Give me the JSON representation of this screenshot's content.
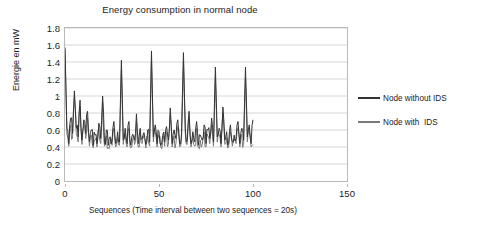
{
  "chart_data": {
    "type": "line",
    "title": "Energy consumption in normal node",
    "xlabel": "Sequences (Time interval between two  sequences = 20s)",
    "ylabel": "Energie en mW",
    "xlim": [
      0,
      150
    ],
    "ylim": [
      0,
      1.8
    ],
    "xticks": [
      "0",
      "50",
      "100",
      "150"
    ],
    "xtick_values": [
      0,
      50,
      100,
      150
    ],
    "yticks": [
      "0",
      "0.2",
      "0.4",
      "0.6",
      "0.8",
      "1",
      "1.2",
      "1.4",
      "1.6",
      "1.8"
    ],
    "ytick_values": [
      0,
      0.2,
      0.4,
      0.6,
      0.8,
      1,
      1.2,
      1.4,
      1.6,
      1.8
    ],
    "grid": "horizontal",
    "legend_position": "right",
    "colors": {
      "series1": "#333333",
      "series2": "#7a7a7a",
      "grid": "#d6d6d6",
      "frame": "#b9b9b9"
    },
    "series": [
      {
        "name": "Node without IDS",
        "color": "#333333",
        "x": [
          0,
          1,
          2,
          3,
          4,
          5,
          6,
          7,
          8,
          9,
          10,
          11,
          12,
          13,
          14,
          15,
          16,
          17,
          18,
          19,
          20,
          21,
          22,
          23,
          24,
          25,
          26,
          27,
          28,
          29,
          30,
          31,
          32,
          33,
          34,
          35,
          36,
          37,
          38,
          39,
          40,
          41,
          42,
          43,
          44,
          45,
          46,
          47,
          48,
          49,
          50,
          51,
          52,
          53,
          54,
          55,
          56,
          57,
          58,
          59,
          60,
          61,
          62,
          63,
          64,
          65,
          66,
          67,
          68,
          69,
          70,
          71,
          72,
          73,
          74,
          75,
          76,
          77,
          78,
          79,
          80,
          81,
          82,
          83,
          84,
          85,
          86,
          87,
          88,
          89,
          90,
          91,
          92,
          93,
          94,
          95,
          96,
          97,
          98,
          99,
          100
        ],
        "values": [
          1.57,
          0.62,
          0.44,
          0.74,
          0.56,
          1.06,
          0.62,
          0.52,
          0.95,
          0.48,
          0.72,
          0.56,
          0.82,
          0.46,
          0.6,
          0.42,
          0.54,
          0.44,
          0.68,
          0.5,
          1.0,
          0.45,
          0.6,
          0.42,
          0.52,
          0.47,
          0.7,
          0.44,
          0.58,
          0.46,
          1.42,
          0.48,
          0.62,
          0.44,
          0.7,
          0.42,
          0.55,
          0.48,
          0.79,
          0.44,
          0.62,
          0.5,
          0.57,
          0.43,
          0.6,
          0.46,
          1.53,
          0.52,
          0.66,
          0.44,
          0.58,
          0.42,
          0.54,
          0.46,
          0.64,
          0.48,
          0.86,
          0.44,
          0.6,
          0.5,
          0.72,
          0.44,
          0.56,
          1.51,
          0.62,
          0.48,
          0.82,
          0.44,
          0.58,
          0.46,
          0.7,
          0.42,
          0.54,
          0.48,
          0.66,
          0.44,
          0.6,
          0.5,
          0.74,
          0.46,
          1.34,
          0.52,
          0.62,
          0.44,
          0.87,
          0.48,
          0.58,
          0.44,
          0.66,
          0.46,
          0.54,
          0.5,
          0.7,
          0.44,
          0.62,
          0.48,
          1.34,
          0.52,
          0.66,
          0.44,
          0.72
        ]
      },
      {
        "name": "Node with  IDS",
        "color": "#7a7a7a",
        "x": [
          0,
          1,
          2,
          3,
          4,
          5,
          6,
          7,
          8,
          9,
          10,
          11,
          12,
          13,
          14,
          15,
          16,
          17,
          18,
          19,
          20,
          21,
          22,
          23,
          24,
          25,
          26,
          27,
          28,
          29,
          30,
          31,
          32,
          33,
          34,
          35,
          36,
          37,
          38,
          39,
          40,
          41,
          42,
          43,
          44,
          45,
          46,
          47,
          48,
          49,
          50,
          51,
          52,
          53,
          54,
          55,
          56,
          57,
          58,
          59,
          60,
          61,
          62,
          63,
          64,
          65,
          66,
          67,
          68,
          69,
          70,
          71,
          72,
          73,
          74,
          75,
          76,
          77,
          78,
          79,
          80,
          81,
          82,
          83,
          84,
          85,
          86,
          87,
          88,
          89,
          90,
          91,
          92,
          93,
          94,
          95,
          96,
          97,
          98,
          99,
          100
        ],
        "values": [
          1.55,
          0.55,
          0.41,
          0.66,
          0.5,
          0.98,
          0.56,
          0.46,
          0.88,
          0.43,
          0.64,
          0.5,
          0.74,
          0.41,
          0.54,
          0.39,
          0.48,
          0.4,
          0.6,
          0.44,
          0.92,
          0.41,
          0.53,
          0.39,
          0.46,
          0.42,
          0.62,
          0.4,
          0.51,
          0.42,
          1.3,
          0.43,
          0.55,
          0.4,
          0.62,
          0.39,
          0.49,
          0.43,
          0.7,
          0.4,
          0.55,
          0.44,
          0.5,
          0.39,
          0.53,
          0.41,
          1.4,
          0.46,
          0.58,
          0.4,
          0.51,
          0.39,
          0.48,
          0.41,
          0.57,
          0.43,
          0.78,
          0.4,
          0.53,
          0.44,
          0.64,
          0.4,
          0.5,
          1.4,
          0.55,
          0.43,
          0.74,
          0.4,
          0.51,
          0.41,
          0.62,
          0.39,
          0.48,
          0.43,
          0.58,
          0.4,
          0.53,
          0.44,
          0.66,
          0.41,
          1.22,
          0.46,
          0.55,
          0.4,
          0.79,
          0.43,
          0.51,
          0.4,
          0.58,
          0.41,
          0.48,
          0.44,
          0.62,
          0.4,
          0.55,
          0.43,
          1.22,
          0.46,
          0.58,
          0.4,
          0.43
        ]
      }
    ]
  }
}
